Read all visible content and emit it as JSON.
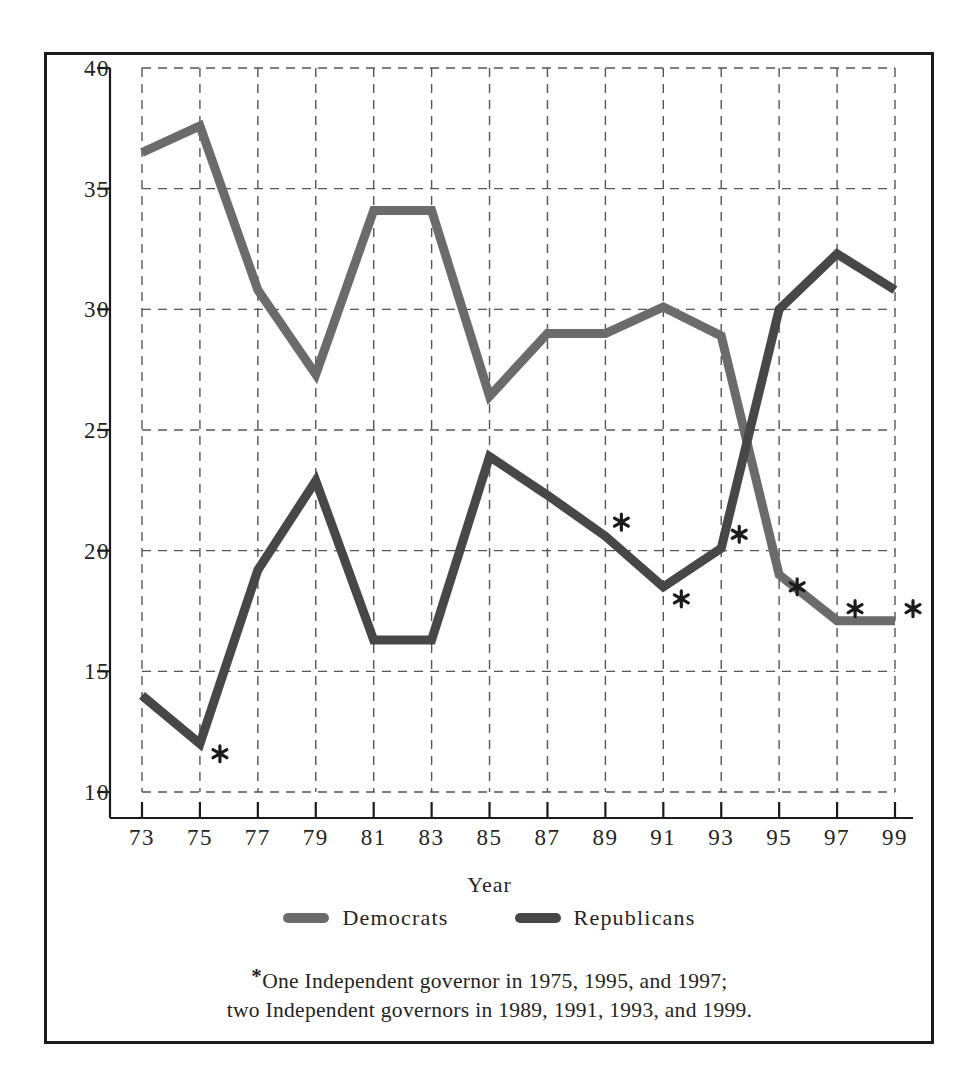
{
  "chart_data": {
    "type": "line",
    "title": "",
    "xlabel": "Year",
    "ylabel": "",
    "x": [
      73,
      75,
      77,
      79,
      81,
      83,
      85,
      87,
      89,
      91,
      93,
      95,
      97,
      99
    ],
    "categories": [
      "73",
      "75",
      "77",
      "79",
      "81",
      "83",
      "85",
      "87",
      "89",
      "91",
      "93",
      "95",
      "97",
      "99"
    ],
    "series": [
      {
        "name": "Democrats",
        "color": "#6b6b6b",
        "values": [
          36.5,
          37.6,
          30.8,
          27.3,
          34.1,
          34.1,
          26.4,
          29.0,
          29.0,
          30.1,
          28.9,
          19.0,
          17.1,
          17.1
        ]
      },
      {
        "name": "Republicans",
        "color": "#474747",
        "values": [
          14.0,
          12.0,
          19.2,
          22.9,
          16.3,
          16.3,
          23.9,
          22.3,
          20.6,
          18.5,
          20.1,
          30.0,
          32.3,
          30.8
        ]
      }
    ],
    "ylim": [
      10,
      40
    ],
    "yticks": [
      10,
      15,
      20,
      25,
      30,
      35,
      40
    ],
    "ytick_labels": [
      "10",
      "15",
      "20",
      "25",
      "30",
      "35",
      "40"
    ],
    "xlim": [
      73,
      99
    ],
    "grid": "dashed",
    "legend_position": "below-axes",
    "annotations": [
      {
        "symbol": "*",
        "near_series": "Republicans",
        "x": 75,
        "y": 12.0
      },
      {
        "symbol": "*",
        "near_series": "Republicans",
        "x": 89,
        "y": 20.6
      },
      {
        "symbol": "*",
        "near_series": "Republicans",
        "x": 91,
        "y": 18.5
      },
      {
        "symbol": "*",
        "near_series": "Republicans",
        "x": 93,
        "y": 20.1
      },
      {
        "symbol": "*",
        "near_series": "Democrats",
        "x": 95,
        "y": 19.0
      },
      {
        "symbol": "*",
        "near_series": "Democrats",
        "x": 97,
        "y": 17.1
      },
      {
        "symbol": "*",
        "near_series": "Democrats",
        "x": 99,
        "y": 17.1
      }
    ]
  },
  "axis": {
    "x_title": "Year",
    "y_tick_labels": [
      "40",
      "35",
      "30",
      "25",
      "20",
      "15",
      "10"
    ],
    "x_tick_labels": [
      "73",
      "75",
      "77",
      "79",
      "81",
      "83",
      "85",
      "87",
      "89",
      "91",
      "93",
      "95",
      "97",
      "99"
    ]
  },
  "legend": {
    "entries": [
      {
        "label": "Democrats",
        "color": "#6b6b6b"
      },
      {
        "label": "Republicans",
        "color": "#474747"
      }
    ]
  },
  "footnote": {
    "marker": "*",
    "line1": "One Independent governor in 1975, 1995, and 1997;",
    "line2": "two Independent governors in 1989, 1991, 1993, and 1999."
  }
}
